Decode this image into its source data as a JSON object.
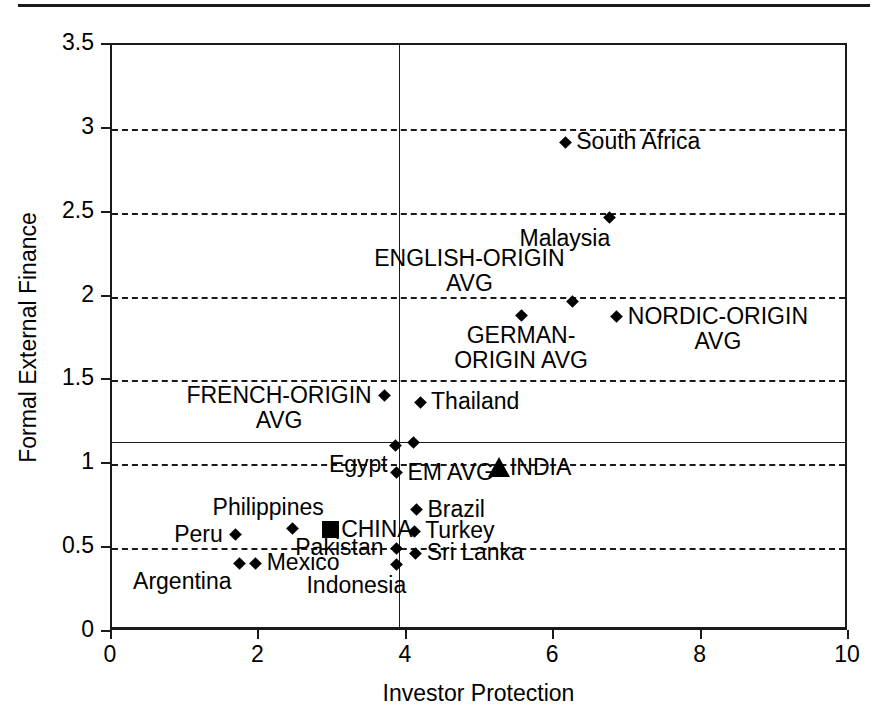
{
  "chart_data": {
    "type": "scatter",
    "title": "",
    "xlabel": "Investor Protection",
    "ylabel": "Formal External Finance",
    "xlim": [
      0,
      10
    ],
    "ylim": [
      0,
      3.5
    ],
    "xticks": [
      "0",
      "2",
      "4",
      "6",
      "8",
      "10"
    ],
    "xtick_values": [
      0,
      2,
      4,
      6,
      8,
      10
    ],
    "yticks": [
      "0",
      "0.5",
      "1",
      "1.5",
      "2",
      "2.5",
      "3",
      "3.5"
    ],
    "ytick_values": [
      0,
      0.5,
      1,
      1.5,
      2,
      2.5,
      3,
      3.5
    ],
    "grid": "horizontal dashed gridlines at y = 0.5, 1, 1.5, 2, 2.5, 3",
    "gridline_values": [
      0.5,
      1,
      1.5,
      2,
      2.5,
      3
    ],
    "reference_lines": [
      {
        "name": "em-avg-finance-line",
        "orientation": "horizontal",
        "value": 1.13,
        "style": "solid"
      },
      {
        "name": "em-avg-protection-line",
        "orientation": "vertical",
        "value": 3.9,
        "style": "solid"
      }
    ],
    "legend": "none",
    "points": [
      {
        "label": "South Africa",
        "x": 6.15,
        "y": 2.92,
        "marker": "diamond",
        "label_pos": "right"
      },
      {
        "label": "Malaysia",
        "x": 6.75,
        "y": 2.47,
        "marker": "diamond",
        "label_pos": "below"
      },
      {
        "label": "ENGLISH-ORIGIN\nAVG",
        "x": 6.25,
        "y": 1.97,
        "marker": "diamond",
        "label_pos": "above-left"
      },
      {
        "label": "NORDIC-ORIGIN\nAVG",
        "x": 6.85,
        "y": 1.88,
        "marker": "diamond",
        "label_pos": "right"
      },
      {
        "label": "GERMAN-\nORIGIN AVG",
        "x": 5.55,
        "y": 1.89,
        "marker": "diamond",
        "label_pos": "below"
      },
      {
        "label": "FRENCH-ORIGIN\nAVG",
        "x": 3.7,
        "y": 1.41,
        "marker": "diamond",
        "label_pos": "left"
      },
      {
        "label": "Thailand",
        "x": 4.18,
        "y": 1.37,
        "marker": "diamond",
        "label_pos": "right"
      },
      {
        "label": "Egypt",
        "x": 3.85,
        "y": 1.11,
        "marker": "diamond",
        "label_pos": "below-left"
      },
      {
        "label": "",
        "x": 4.09,
        "y": 1.13,
        "marker": "diamond",
        "label_pos": "none"
      },
      {
        "label": "EM AVG",
        "x": 3.86,
        "y": 0.95,
        "marker": "diamond",
        "label_pos": "right"
      },
      {
        "label": "INDIA",
        "x": 5.25,
        "y": 0.98,
        "marker": "triangle",
        "label_pos": "right"
      },
      {
        "label": "Brazil",
        "x": 4.13,
        "y": 0.73,
        "marker": "diamond",
        "label_pos": "right"
      },
      {
        "label": "Philippines",
        "x": 2.45,
        "y": 0.62,
        "marker": "diamond",
        "label_pos": "above"
      },
      {
        "label": "CHINA",
        "x": 2.96,
        "y": 0.61,
        "marker": "square",
        "label_pos": "right"
      },
      {
        "label": "Peru",
        "x": 1.68,
        "y": 0.58,
        "marker": "diamond",
        "label_pos": "left"
      },
      {
        "label": "Turkey",
        "x": 4.1,
        "y": 0.6,
        "marker": "diamond",
        "label_pos": "right"
      },
      {
        "label": "Pakistan",
        "x": 3.86,
        "y": 0.5,
        "marker": "diamond",
        "label_pos": "left"
      },
      {
        "label": "Sri Lanka",
        "x": 4.12,
        "y": 0.47,
        "marker": "diamond",
        "label_pos": "right"
      },
      {
        "label": "Indonesia",
        "x": 3.86,
        "y": 0.4,
        "marker": "diamond",
        "label_pos": "below"
      },
      {
        "label": "Mexico",
        "x": 1.95,
        "y": 0.41,
        "marker": "diamond",
        "label_pos": "right"
      },
      {
        "label": "Argentina",
        "x": 1.73,
        "y": 0.41,
        "marker": "diamond",
        "label_pos": "below-left"
      }
    ],
    "labels_text": {
      "south_africa": "South Africa",
      "malaysia": "Malaysia",
      "english_origin_avg_line1": "ENGLISH-ORIGIN",
      "english_origin_avg_line2": "AVG",
      "nordic_origin_avg_line1": "NORDIC-ORIGIN",
      "nordic_origin_avg_line2": "AVG",
      "german_origin_avg_line1": "GERMAN-",
      "german_origin_avg_line2": "ORIGIN AVG",
      "french_origin_avg_line1": "FRENCH-ORIGIN",
      "french_origin_avg_line2": "AVG",
      "thailand": "Thailand",
      "egypt": "Egypt",
      "em_avg": "EM AVG",
      "india": "INDIA",
      "brazil": "Brazil",
      "philippines": "Philippines",
      "china": "CHINA",
      "peru": "Peru",
      "turkey": "Turkey",
      "pakistan": "Pakistan",
      "sri_lanka": "Sri Lanka",
      "indonesia": "Indonesia",
      "mexico": "Mexico",
      "argentina": "Argentina"
    }
  },
  "axes": {
    "x_title": "Investor Protection",
    "y_title": "Formal External Finance",
    "x_tick_labels": [
      "0",
      "2",
      "4",
      "6",
      "8",
      "10"
    ],
    "y_tick_labels": [
      "0",
      "0.5",
      "1",
      "1.5",
      "2",
      "2.5",
      "3",
      "3.5"
    ]
  },
  "colors": {
    "ink": "#1a1a1a",
    "marker": "#000000",
    "background": "#ffffff"
  }
}
